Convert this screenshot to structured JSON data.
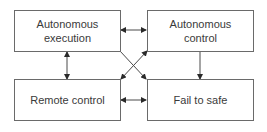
{
  "diagram": {
    "nodes": [
      {
        "id": "autonomous-execution",
        "label_line1": "Autonomous",
        "label_line2": "execution"
      },
      {
        "id": "autonomous-control",
        "label_line1": "Autonomous",
        "label_line2": "control"
      },
      {
        "id": "remote-control",
        "label_line1": "Remote control",
        "label_line2": ""
      },
      {
        "id": "fail-to-safe",
        "label_line1": "Fail to safe",
        "label_line2": ""
      }
    ],
    "edges": [
      {
        "from": "autonomous-execution",
        "to": "autonomous-control",
        "type": "bidirectional"
      },
      {
        "from": "autonomous-execution",
        "to": "remote-control",
        "type": "bidirectional"
      },
      {
        "from": "remote-control",
        "to": "fail-to-safe",
        "type": "bidirectional"
      },
      {
        "from": "autonomous-control",
        "to": "fail-to-safe",
        "type": "directed"
      },
      {
        "from": "autonomous-execution",
        "to": "fail-to-safe",
        "type": "directed"
      },
      {
        "from": "remote-control",
        "to": "autonomous-control",
        "type": "directed"
      }
    ],
    "colors": {
      "line": "#4a4a4a",
      "border": "#6a6a6a",
      "text": "#3a3a3a"
    }
  }
}
